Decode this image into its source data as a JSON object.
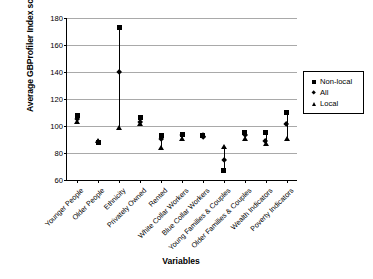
{
  "chart_data": {
    "type": "scatter",
    "title": "",
    "xlabel": "Variables",
    "ylabel": "Average GBProfiler Index score",
    "ylim": [
      60,
      180
    ],
    "yticks": [
      60,
      80,
      100,
      120,
      140,
      160,
      180
    ],
    "grid": true,
    "legend_position": "right",
    "categories": [
      "Younger People",
      "Older People",
      "Ethnicity",
      "Privately Owned",
      "Rented",
      "White Collar Workers",
      "Blue Collar Workers",
      "Young Families & Couples",
      "Older Families & Couples",
      "Wealth Indicators",
      "Poverty Indicators"
    ],
    "series": [
      {
        "name": "Non-local",
        "marker": "square",
        "values": [
          108,
          88,
          173,
          106,
          93,
          94,
          93,
          67,
          95,
          95,
          110
        ]
      },
      {
        "name": "All",
        "marker": "diamond",
        "values": [
          105,
          88,
          140,
          103,
          90,
          93,
          92,
          75,
          93,
          89,
          101
        ]
      },
      {
        "name": "Local",
        "marker": "triangle",
        "values": [
          103,
          89,
          99,
          102,
          84,
          91,
          94,
          85,
          91,
          87,
          91
        ]
      }
    ]
  },
  "legend": {
    "entries": [
      {
        "label": "Non-local",
        "marker": "square"
      },
      {
        "label": "All",
        "marker": "diamond"
      },
      {
        "label": "Local",
        "marker": "triangle"
      }
    ]
  }
}
